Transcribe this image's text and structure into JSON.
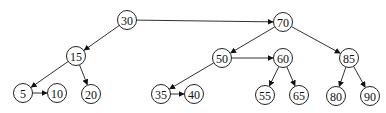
{
  "diagram": {
    "type": "B+ tree / binary tree with sibling links",
    "nodes": [
      {
        "id": "n30",
        "label": "30",
        "x": 127,
        "y": 20
      },
      {
        "id": "n70",
        "label": "70",
        "x": 283,
        "y": 22
      },
      {
        "id": "n15",
        "label": "15",
        "x": 76,
        "y": 56
      },
      {
        "id": "n50",
        "label": "50",
        "x": 222,
        "y": 58
      },
      {
        "id": "n60",
        "label": "60",
        "x": 283,
        "y": 58
      },
      {
        "id": "n85",
        "label": "85",
        "x": 349,
        "y": 58
      },
      {
        "id": "n5",
        "label": "5",
        "x": 23,
        "y": 93
      },
      {
        "id": "n10",
        "label": "10",
        "x": 57,
        "y": 93
      },
      {
        "id": "n20",
        "label": "20",
        "x": 91,
        "y": 94
      },
      {
        "id": "n35",
        "label": "35",
        "x": 161,
        "y": 94
      },
      {
        "id": "n40",
        "label": "40",
        "x": 194,
        "y": 94
      },
      {
        "id": "n55",
        "label": "55",
        "x": 265,
        "y": 95
      },
      {
        "id": "n65",
        "label": "65",
        "x": 299,
        "y": 95
      },
      {
        "id": "n80",
        "label": "80",
        "x": 336,
        "y": 96
      },
      {
        "id": "n90",
        "label": "90",
        "x": 370,
        "y": 96
      }
    ],
    "edges": [
      {
        "from": "n30",
        "to": "n15",
        "kind": "child"
      },
      {
        "from": "n30",
        "to": "n70",
        "kind": "sibling"
      },
      {
        "from": "n15",
        "to": "n5",
        "kind": "child"
      },
      {
        "from": "n15",
        "to": "n20",
        "kind": "child"
      },
      {
        "from": "n5",
        "to": "n10",
        "kind": "sibling"
      },
      {
        "from": "n70",
        "to": "n50",
        "kind": "child"
      },
      {
        "from": "n70",
        "to": "n85",
        "kind": "child"
      },
      {
        "from": "n50",
        "to": "n35",
        "kind": "child"
      },
      {
        "from": "n50",
        "to": "n60",
        "kind": "sibling"
      },
      {
        "from": "n35",
        "to": "n40",
        "kind": "sibling"
      },
      {
        "from": "n60",
        "to": "n55",
        "kind": "child"
      },
      {
        "from": "n60",
        "to": "n65",
        "kind": "child"
      },
      {
        "from": "n85",
        "to": "n80",
        "kind": "child"
      },
      {
        "from": "n85",
        "to": "n90",
        "kind": "child"
      }
    ],
    "node_radius": 9.5,
    "colors": {
      "stroke": "#222222",
      "background": "#ffffff"
    }
  }
}
